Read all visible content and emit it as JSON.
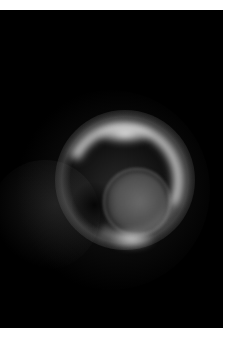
{
  "image": {
    "description": "Grayscale glowing ring/spiral structure with an inner disc on a black background",
    "background_color": "#000000",
    "margin_color": "#ffffff",
    "bright_color": "#ebebeb"
  }
}
